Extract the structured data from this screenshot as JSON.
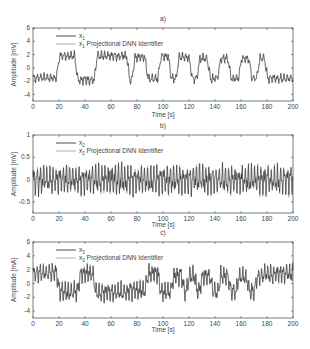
{
  "chart_data": [
    {
      "panel": "a)",
      "type": "line",
      "title": "a)",
      "xlabel": "Time [s]",
      "ylabel": "Amplitude [mV]",
      "xlim": [
        0,
        200
      ],
      "ylim": [
        -5,
        6
      ],
      "xticks": [
        0,
        20,
        40,
        60,
        80,
        100,
        120,
        140,
        160,
        180,
        200
      ],
      "yticks": [
        6,
        4,
        2,
        0,
        -2,
        -4
      ],
      "legend": [
        {
          "label": "x",
          "sub": "1",
          "suffix": "",
          "color": "#222222"
        },
        {
          "label": "x",
          "sub": "1",
          "suffix": " Projectional DNN Identifier",
          "color": "#9a9a9a"
        }
      ],
      "series": [
        {
          "name": "x1",
          "description": "square-like switching between ~+2 and ~-2 with ripple",
          "levels": [
            [
              0,
              -1.5
            ],
            [
              18,
              1.8
            ],
            [
              32,
              -1.8
            ],
            [
              47,
              1.8
            ],
            [
              72,
              -1.8
            ],
            [
              76,
              1.6
            ],
            [
              86,
              -1.6
            ],
            [
              96,
              1.7
            ],
            [
              104,
              -1.6
            ],
            [
              110,
              1.6
            ],
            [
              120,
              -1.6
            ],
            [
              126,
              1.4
            ],
            [
              134,
              -1.6
            ],
            [
              142,
              1.4
            ],
            [
              150,
              -1.6
            ],
            [
              158,
              1.4
            ],
            [
              166,
              -1.6
            ],
            [
              172,
              1.4
            ],
            [
              178,
              -1.6
            ],
            [
              200,
              -1.6
            ]
          ]
        },
        {
          "name": "x1 Projectional DNN Identifier",
          "description": "tracks x1 closely"
        }
      ],
      "ripple_amp": 0.7,
      "ripple_period": 2.6
    },
    {
      "panel": "b)",
      "type": "line",
      "title": "b)",
      "xlabel": "Time [s]",
      "ylabel": "Amplitude [mV]",
      "xlim": [
        0,
        200
      ],
      "ylim": [
        -0.75,
        1
      ],
      "xticks": [
        0,
        20,
        40,
        60,
        80,
        100,
        120,
        140,
        160,
        180,
        200
      ],
      "yticks": [
        1,
        0.5,
        0,
        -0.5
      ],
      "legend": [
        {
          "label": "x",
          "sub": "2",
          "suffix": "",
          "color": "#222222"
        },
        {
          "label": "x",
          "sub": "2",
          "suffix": " Projectional DNN Identifier",
          "color": "#9a9a9a"
        }
      ],
      "series": [
        {
          "name": "x2",
          "description": "oscillation around 0 with amplitude ~0.3-0.4",
          "levels": [
            [
              0,
              0
            ],
            [
              200,
              0
            ]
          ]
        },
        {
          "name": "x2 Projectional DNN Identifier",
          "description": "tracks x2 closely"
        }
      ],
      "ripple_amp": 0.33,
      "ripple_period": 2.5
    },
    {
      "panel": "c)",
      "type": "line",
      "title": "c)",
      "xlabel": "Time [s]",
      "ylabel": "Amplitude [mA]",
      "xlim": [
        0,
        200
      ],
      "ylim": [
        -5,
        6
      ],
      "xticks": [
        0,
        20,
        40,
        60,
        80,
        100,
        120,
        140,
        160,
        180,
        200
      ],
      "yticks": [
        6,
        4,
        2,
        0,
        -2,
        -4
      ],
      "legend": [
        {
          "label": "x",
          "sub": "3",
          "suffix": "",
          "color": "#222222"
        },
        {
          "label": "x",
          "sub": "3",
          "suffix": " Projectional DNN Identifier",
          "color": "#9a9a9a"
        }
      ],
      "series": [
        {
          "name": "x3",
          "description": "alternating plateaus ~+1.5 and ~-1.5 with large ripple",
          "levels": [
            [
              0,
              1.5
            ],
            [
              18,
              -1.2
            ],
            [
              34,
              1.4
            ],
            [
              46,
              -1.3
            ],
            [
              72,
              -1.0
            ],
            [
              86,
              1.5
            ],
            [
              96,
              -1.2
            ],
            [
              106,
              1.2
            ],
            [
              114,
              -1.2
            ],
            [
              118,
              1.2
            ],
            [
              124,
              -1.2
            ],
            [
              128,
              1.0
            ],
            [
              136,
              -1.2
            ],
            [
              142,
              1.0
            ],
            [
              150,
              -1.2
            ],
            [
              156,
              1.0
            ],
            [
              164,
              -1.2
            ],
            [
              170,
              1.0
            ],
            [
              176,
              1.4
            ],
            [
              200,
              1.4
            ]
          ]
        },
        {
          "name": "x3 Projectional DNN Identifier",
          "description": "tracks x3 closely"
        }
      ],
      "ripple_amp": 1.4,
      "ripple_period": 2.4
    }
  ],
  "layout": {
    "panels": [
      {
        "left": 33,
        "right": 293,
        "top": 28,
        "bottom": 101,
        "title_y": 21,
        "xlabel_y": 117
      },
      {
        "left": 33,
        "right": 293,
        "top": 135,
        "bottom": 213,
        "title_y": 128,
        "xlabel_y": 227
      },
      {
        "left": 33,
        "right": 293,
        "top": 242,
        "bottom": 318,
        "title_y": 235,
        "xlabel_y": 332
      }
    ]
  }
}
